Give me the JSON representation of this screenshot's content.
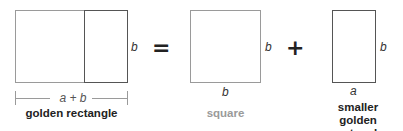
{
  "diagram": {
    "golden_rectangle": {
      "side_label": "b",
      "width_label": "a + b",
      "caption": "golden rectangle"
    },
    "equals_sign": "=",
    "square": {
      "side_label": "b",
      "bottom_label": "b",
      "caption": "square"
    },
    "plus_sign": "+",
    "smaller_golden_rectangle": {
      "side_label": "b",
      "bottom_label": "a",
      "caption_line1": "smaller golden",
      "caption_line2": "rectangle"
    },
    "colors": {
      "dark_line": "#555555",
      "light_line": "#9a9a9a",
      "square_caption": "#9a9a9a",
      "caption": "#222222"
    }
  }
}
